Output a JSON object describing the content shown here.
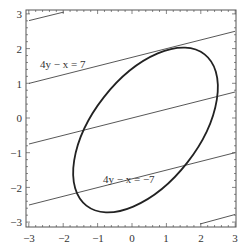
{
  "chart_data": {
    "type": "line",
    "title": "",
    "xlabel": "",
    "ylabel": "",
    "xlim": [
      -3,
      3
    ],
    "ylim": [
      -3,
      3
    ],
    "x_ticks": [
      "-3",
      "-2",
      "-1",
      "0",
      "1",
      "2",
      "3"
    ],
    "y_ticks": [
      "3",
      "2",
      "1",
      "0",
      "-1",
      "-2",
      "-3"
    ],
    "grid": false,
    "series": [
      {
        "name": "4y - x = 14",
        "type": "line",
        "slope": 0.25,
        "intercept": 3.5
      },
      {
        "name": "4y - x = 7",
        "type": "line",
        "slope": 0.25,
        "intercept": 1.75
      },
      {
        "name": "4y - x = 0",
        "type": "line",
        "slope": 0.25,
        "intercept": 0
      },
      {
        "name": "4y - x = -7",
        "type": "line",
        "slope": 0.25,
        "intercept": -1.75
      },
      {
        "name": "4y - x = -14",
        "type": "line",
        "slope": 0.25,
        "intercept": -3.5
      },
      {
        "name": "ellipse",
        "type": "curve",
        "center": [
          0.4,
          -0.35
        ],
        "extent_x": [
          -1.9,
          2.75
        ],
        "extent_y": [
          -2.75,
          2.05
        ],
        "tilt_deg": 52
      }
    ],
    "annotations": [
      {
        "text": "4y − x = 7",
        "x": -2.6,
        "y": 1.45
      },
      {
        "text": "4y − x = −7",
        "x": -0.4,
        "y": -1.75
      }
    ]
  },
  "labels": {
    "anno_top": "4y − x = 7",
    "anno_bottom": "4y − x = −7",
    "x_ticks": [
      "−3",
      "−2",
      "−1",
      "0",
      "1",
      "2",
      "3"
    ],
    "y_ticks": [
      "3",
      "2",
      "1",
      "0",
      "−1",
      "−2",
      "−3"
    ]
  }
}
